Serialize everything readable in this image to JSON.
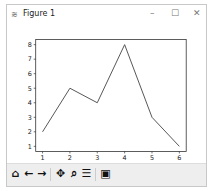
{
  "window": {
    "title": "Figure 1",
    "minimize": "–",
    "maximize": "☐",
    "close": "✕",
    "icon": "≋"
  },
  "toolbar": {
    "home": "⌂",
    "back": "←",
    "forward": "→",
    "pan": "✥",
    "zoom": "⌕",
    "configure": "☰",
    "save": "▣"
  },
  "chart_data": {
    "type": "line",
    "title": "",
    "xlabel": "",
    "ylabel": "",
    "x": [
      1,
      2,
      3,
      4,
      5,
      6
    ],
    "series": [
      {
        "name": "line",
        "values": [
          2,
          5,
          4,
          8,
          3,
          1
        ],
        "color": "#555555"
      }
    ],
    "xticks": [
      "1",
      "2",
      "3",
      "4",
      "5",
      "6"
    ],
    "yticks": [
      "1",
      "2",
      "3",
      "4",
      "5",
      "6",
      "7",
      "8"
    ],
    "xlim": [
      0.75,
      6.25
    ],
    "ylim": [
      0.65,
      8.35
    ],
    "grid": false
  }
}
